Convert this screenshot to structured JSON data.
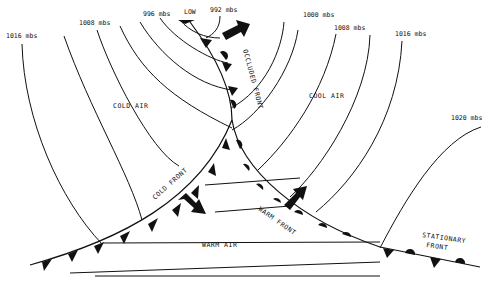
{
  "diagram": {
    "type": "weather-map-frontal-system",
    "isobar_labels": [
      {
        "text": "1016 mbs",
        "x": 6,
        "y": 38
      },
      {
        "text": "1008 mbs",
        "x": 79,
        "y": 25
      },
      {
        "text": "996 mbs",
        "x": 143,
        "y": 16
      },
      {
        "text": "LOW",
        "x": 184,
        "y": 14
      },
      {
        "text": "992 mbs",
        "x": 210,
        "y": 12
      },
      {
        "text": "1000 mbs",
        "x": 303,
        "y": 17
      },
      {
        "text": "1008 mbs",
        "x": 334,
        "y": 30
      },
      {
        "text": "1016 mbs",
        "x": 395,
        "y": 36
      },
      {
        "text": "1020 mbs",
        "x": 451,
        "y": 120
      }
    ],
    "air_masses": [
      {
        "text": "COLD AIR",
        "x": 113,
        "y": 108
      },
      {
        "text": "COOL AIR",
        "x": 309,
        "y": 98
      },
      {
        "text": "WARM AIR",
        "x": 202,
        "y": 247
      }
    ],
    "fronts": [
      {
        "text": "COLD FRONT",
        "type": "cold"
      },
      {
        "text": "WARM FRONT",
        "type": "warm"
      },
      {
        "text": "OCCLUDED FRONT",
        "type": "occluded"
      },
      {
        "text": "STATIONARY",
        "text2": "FRONT",
        "type": "stationary"
      }
    ],
    "arrows": [
      {
        "name": "occluded-motion",
        "direction": "northeast"
      },
      {
        "name": "cold-front-motion",
        "direction": "southeast"
      },
      {
        "name": "warm-front-motion",
        "direction": "northeast"
      }
    ],
    "colors": {
      "ink": "#111111",
      "background": "#ffffff"
    }
  }
}
